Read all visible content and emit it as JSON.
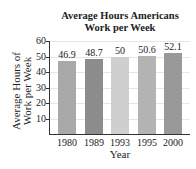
{
  "chart_data": {
    "type": "bar",
    "title": "Average Hours Americans Work per Week",
    "title_lines": [
      "Average Hours Americans",
      "Work per Week"
    ],
    "xlabel": "Year",
    "ylabel": "Average Hours of Work per Week",
    "ylabel_lines": [
      "Average Hours of",
      "Work per Week"
    ],
    "categories": [
      "1980",
      "1989",
      "1993",
      "1995",
      "2000"
    ],
    "values": [
      46.9,
      48.7,
      50,
      50.6,
      52.1
    ],
    "value_labels": [
      "46.9",
      "48.7",
      "50",
      "50.6",
      "52.1"
    ],
    "ylim": [
      0,
      60
    ],
    "yticks": [
      "10",
      "20",
      "30",
      "40",
      "50",
      "60"
    ],
    "grid": true,
    "legend": null,
    "bar_colors": [
      "#a9a9a9",
      "#8c8c8c",
      "#cfcfcf",
      "#b3b3b3",
      "#999999"
    ]
  }
}
